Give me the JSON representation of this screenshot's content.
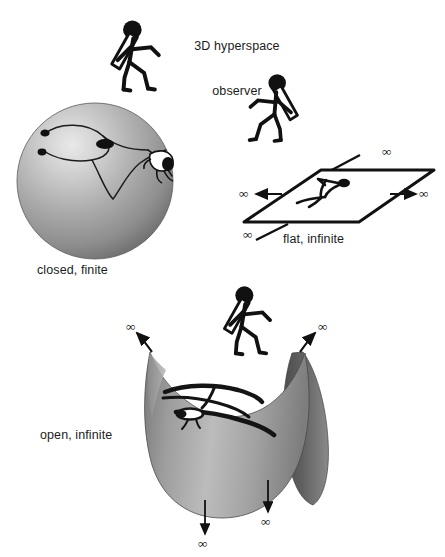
{
  "figure": {
    "background_color": "#ffffff",
    "ink_color": "#1a1a1a",
    "surface_gray_light": "#d7d7d7",
    "surface_gray_mid": "#9a9a9a",
    "surface_gray_dark": "#5e5e5e"
  },
  "labels": {
    "observer_line1": "3D hyperspace",
    "observer_line2": "observer",
    "closed": "closed, finite",
    "flat": "flat, infinite",
    "open": "open, infinite"
  },
  "infinity_symbol": "∞",
  "panels": [
    {
      "id": "closed",
      "geometry": "sphere",
      "label": "closed, finite",
      "curvature": "positive",
      "extent": "finite",
      "has_infinity_arrows": false,
      "infinity_arrow_count": 0,
      "embedded_figure": "stick-figure-on-sphere",
      "has_wandering_path": true
    },
    {
      "id": "flat",
      "geometry": "plane",
      "label": "flat, infinite",
      "curvature": "zero",
      "extent": "infinite",
      "has_infinity_arrows": true,
      "infinity_arrow_count": 4,
      "embedded_figure": "stick-figure-on-plane",
      "has_wandering_path": false
    },
    {
      "id": "open",
      "geometry": "saddle",
      "label": "open, infinite",
      "curvature": "negative",
      "extent": "infinite",
      "has_infinity_arrows": true,
      "infinity_arrow_count": 4,
      "embedded_figure": "stick-figure-on-saddle",
      "has_wandering_path": false
    }
  ],
  "observers": [
    {
      "id": "observer-closed",
      "name": "hyperspace-observer-above-sphere",
      "facing": "right-down"
    },
    {
      "id": "observer-flat",
      "name": "hyperspace-observer-above-plane",
      "facing": "right-down"
    },
    {
      "id": "observer-open",
      "name": "hyperspace-observer-above-saddle",
      "facing": "right-down"
    }
  ],
  "infinity_markers": [
    {
      "panel": "flat",
      "position": "upper-right",
      "symbol": "∞"
    },
    {
      "panel": "flat",
      "position": "left",
      "symbol": "∞"
    },
    {
      "panel": "flat",
      "position": "right",
      "symbol": "∞"
    },
    {
      "panel": "flat",
      "position": "lower-left",
      "symbol": "∞"
    },
    {
      "panel": "open",
      "position": "upper-left",
      "symbol": "∞"
    },
    {
      "panel": "open",
      "position": "upper-right",
      "symbol": "∞"
    },
    {
      "panel": "open",
      "position": "bottom-left",
      "symbol": "∞"
    },
    {
      "panel": "open",
      "position": "bottom-right",
      "symbol": "∞"
    }
  ]
}
